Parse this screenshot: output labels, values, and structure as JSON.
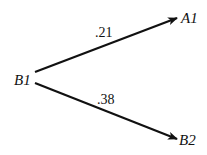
{
  "diagram": {
    "type": "tree",
    "nodes": [
      {
        "id": "B1",
        "label": "B1"
      },
      {
        "id": "A1",
        "label": "A1"
      },
      {
        "id": "B2",
        "label": "B2"
      }
    ],
    "edges": [
      {
        "from": "B1",
        "to": "A1",
        "label": ".21"
      },
      {
        "from": "B1",
        "to": "B2",
        "label": ".38"
      }
    ]
  }
}
